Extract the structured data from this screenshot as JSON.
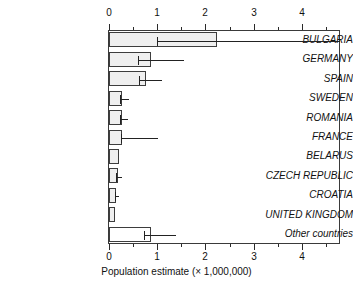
{
  "chart_data": {
    "type": "bar",
    "orientation": "horizontal",
    "title": "",
    "subtitle": "",
    "xlabel": "Population estimate (× 1,000,000)",
    "ylabel": "",
    "xlim": [
      0,
      4.81
    ],
    "ylim": null,
    "grid": false,
    "legend": null,
    "legend_position": "none",
    "axis_top": true,
    "axis_bottom": true,
    "xticks": [
      0,
      1,
      2,
      3,
      4
    ],
    "xtick_labels": [
      "0",
      "1",
      "2",
      "3",
      "4"
    ],
    "xminor_ticks": [
      0.5,
      1.5,
      2.5,
      3.5,
      4.5
    ],
    "categories": [
      "BULGARIA",
      "GERMANY",
      "SPAIN",
      "SWEDEN",
      "ROMANIA",
      "FRANCE",
      "BELARUS",
      "CZECH REPUBLIC",
      "CROATIA",
      "UNITED KINGDOM",
      "Other countries"
    ],
    "values": [
      2.25,
      0.88,
      0.77,
      0.28,
      0.28,
      0.28,
      0.21,
      0.18,
      0.15,
      0.13,
      0.88
    ],
    "errors_low": [
      1.0,
      0.6,
      0.62,
      0.22,
      0.22,
      0.25,
      null,
      0.15,
      0.13,
      null,
      0.72
    ],
    "errors_high": [
      4.81,
      1.55,
      1.1,
      0.42,
      0.4,
      1.02,
      null,
      0.28,
      0.2,
      null,
      1.4
    ],
    "bar_fill_colors": [
      "#efefef",
      "#efefef",
      "#efefef",
      "#efefef",
      "#efefef",
      "#efefef",
      "#efefef",
      "#efefef",
      "#efefef",
      "#efefef",
      "#ffffff"
    ],
    "bar_edge_color": "#3d3d3d",
    "error_bar_color": "#222222",
    "axis_color": "#3a3a3a",
    "background_color": "#ffffff"
  }
}
